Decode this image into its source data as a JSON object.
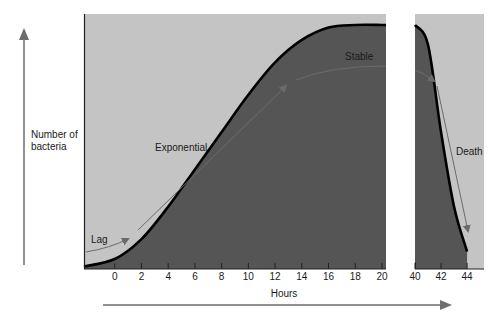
{
  "chart_data": {
    "type": "area",
    "title": "",
    "xlabel": "Hours",
    "ylabel": "Number of bacteria",
    "panels": [
      {
        "name": "growth",
        "xlim": [
          -2.3,
          20.3
        ],
        "ticks": [
          0,
          2,
          4,
          6,
          8,
          10,
          12,
          14,
          16,
          18,
          20
        ],
        "tick_labels": [
          "0",
          "2",
          "4",
          "6",
          "8",
          "10",
          "12",
          "14",
          "16",
          "18",
          "20"
        ]
      },
      {
        "name": "decline",
        "xlim": [
          40,
          45.3
        ],
        "ticks": [
          40,
          42,
          44
        ],
        "tick_labels": [
          "40",
          "42",
          "44"
        ]
      }
    ],
    "ylim": [
      0,
      1
    ],
    "series": [
      {
        "name": "Population curve",
        "points": [
          [
            -2.3,
            0.01
          ],
          [
            0,
            0.04
          ],
          [
            2,
            0.12
          ],
          [
            4,
            0.25
          ],
          [
            6,
            0.4
          ],
          [
            8,
            0.55
          ],
          [
            10,
            0.7
          ],
          [
            12,
            0.83
          ],
          [
            14,
            0.92
          ],
          [
            16,
            0.97
          ],
          [
            18,
            0.98
          ],
          [
            20,
            0.98
          ],
          [
            40,
            0.98
          ],
          [
            41,
            0.9
          ],
          [
            42,
            0.55
          ],
          [
            43,
            0.25
          ],
          [
            44,
            0.07
          ]
        ]
      }
    ],
    "phases": [
      {
        "label": "Lag",
        "range": [
          -2.3,
          1
        ]
      },
      {
        "label": "Exponential",
        "range": [
          2,
          13
        ]
      },
      {
        "label": "Stable",
        "range": [
          13.5,
          20.3
        ]
      },
      {
        "label": "Death",
        "range": [
          40,
          44
        ]
      }
    ],
    "grid": false,
    "legend": "none",
    "colors": {
      "background_fill": "#c4c4c4",
      "under_curve_fill": "#555555",
      "curve": "#000000",
      "phase_arrows": "#6b6b6b",
      "axis_arrows": "#6e6e6e"
    }
  }
}
